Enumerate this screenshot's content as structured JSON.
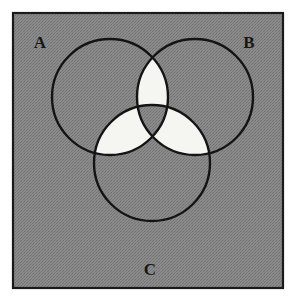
{
  "figure": {
    "frame": {
      "x": 12,
      "y": 12,
      "width": 272,
      "height": 277,
      "border_color": "#1a1a1a",
      "border_width": 2,
      "fill_color": "#808080"
    },
    "colors": {
      "page_background": "#ffffff",
      "shaded_region": "#808080",
      "unshaded_region": "#f5f5f2",
      "stroke": "#141414",
      "label": "#171717"
    },
    "stroke_width": 2.4,
    "sets": [
      {
        "id": "A",
        "label": "A",
        "label_x": 40,
        "label_y": 48,
        "cx": 110,
        "cy": 97,
        "r": 58
      },
      {
        "id": "B",
        "label": "B",
        "label_x": 249,
        "label_y": 48,
        "cx": 195,
        "cy": 97,
        "r": 58
      },
      {
        "id": "C",
        "label": "C",
        "label_x": 150,
        "label_y": 275,
        "cx": 152,
        "cy": 163,
        "r": 58
      }
    ],
    "regions": [
      {
        "id": "A-only",
        "sets": [
          "A"
        ],
        "shaded": true
      },
      {
        "id": "B-only",
        "sets": [
          "B"
        ],
        "shaded": true
      },
      {
        "id": "C-only",
        "sets": [
          "C"
        ],
        "shaded": true
      },
      {
        "id": "A-and-B",
        "sets": [
          "A",
          "B"
        ],
        "shaded": false
      },
      {
        "id": "A-and-C",
        "sets": [
          "A",
          "C"
        ],
        "shaded": false
      },
      {
        "id": "B-and-C",
        "sets": [
          "B",
          "C"
        ],
        "shaded": false
      },
      {
        "id": "A-and-B-and-C",
        "sets": [
          "A",
          "B",
          "C"
        ],
        "shaded": true
      },
      {
        "id": "outside",
        "sets": [],
        "shaded": true
      }
    ]
  }
}
